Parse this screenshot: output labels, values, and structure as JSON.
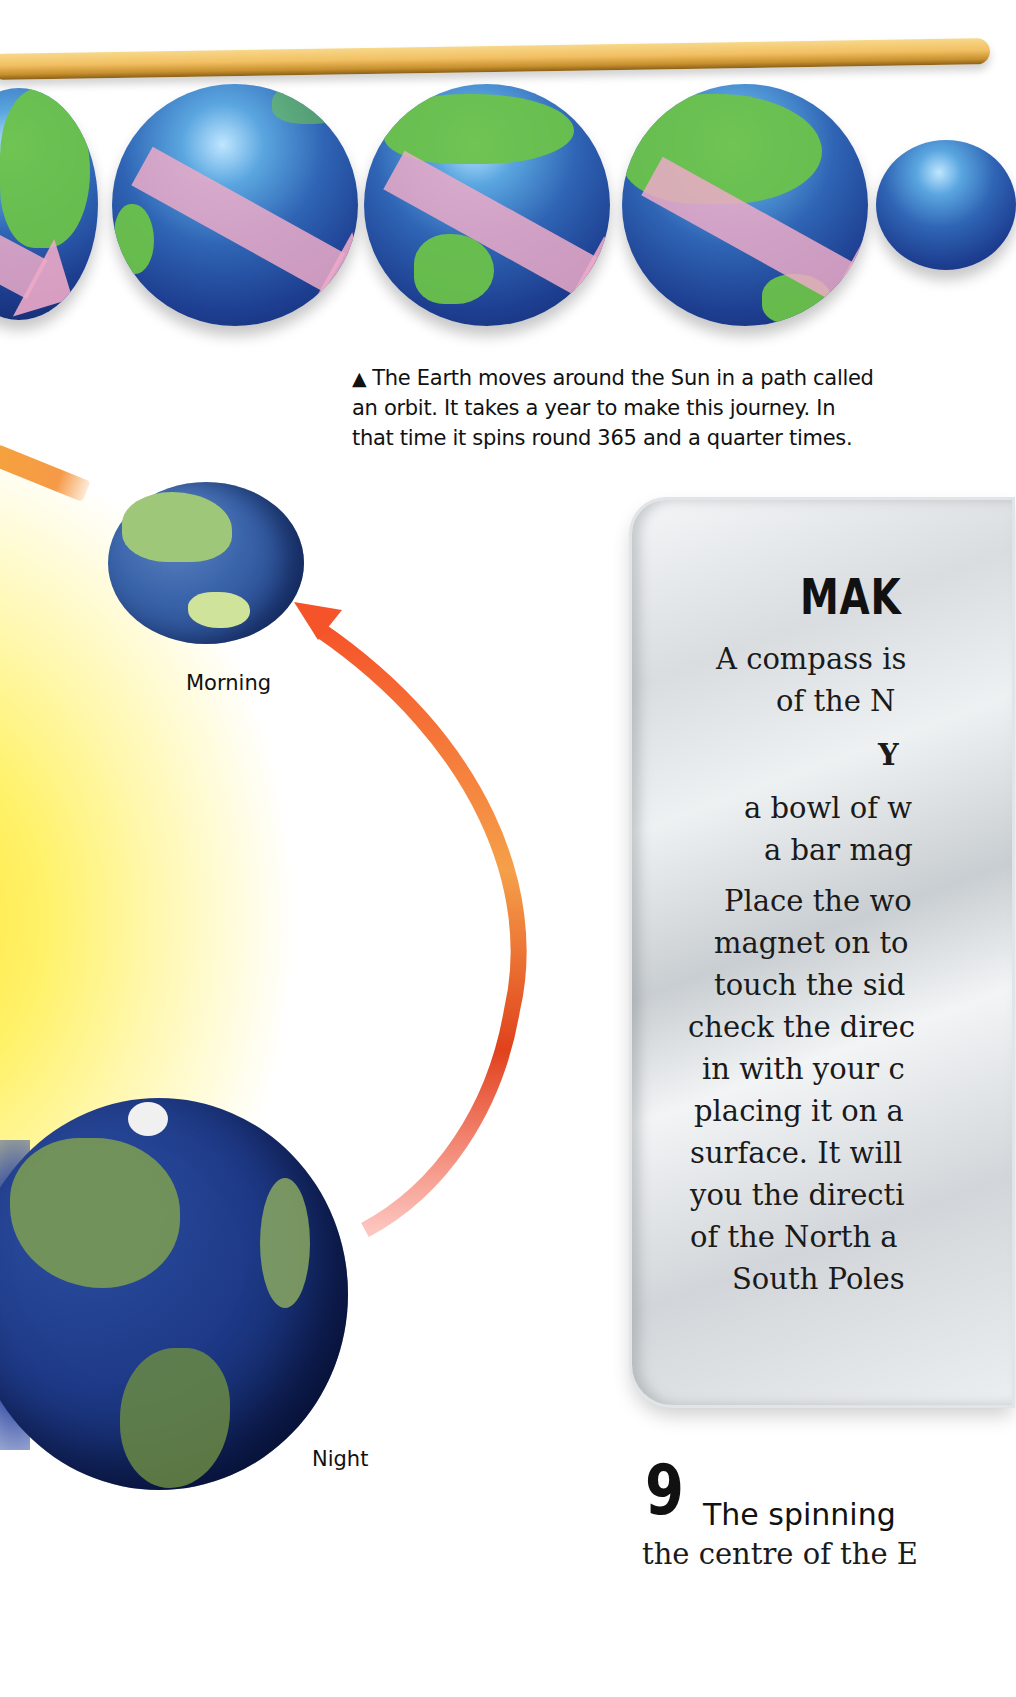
{
  "top_strip": {
    "decoration": "golden-rod",
    "globes": [
      {
        "name": "globe-1",
        "arrow": "pink-spin-arrow"
      },
      {
        "name": "globe-2",
        "arrow": "pink-spin-arrow"
      },
      {
        "name": "globe-3",
        "arrow": "pink-spin-arrow"
      },
      {
        "name": "globe-4",
        "arrow": "pink-spin-arrow"
      },
      {
        "name": "globe-5",
        "arrow": "pink-spin-arrow"
      }
    ],
    "caption": {
      "icon": "up-triangle-icon",
      "icon_glyph": "▲",
      "lines": [
        "The Earth moves around the Sun in a path called",
        "an orbit. It takes a year to make this journey. In",
        "that time it spins round 365 and a quarter times."
      ]
    }
  },
  "diagram": {
    "labels": {
      "morning": "Morning",
      "night": "Night"
    },
    "colors": {
      "sun": "#fff26a",
      "orbit_arrow_start": "#f5542a",
      "orbit_arrow_mid": "#f5a04a",
      "ocean": "#25468a",
      "land": "#7a9a54"
    }
  },
  "compass_panel": {
    "title": "MAK",
    "intro_lines": [
      "A compass is",
      "of the N"
    ],
    "you_need_heading": "Y",
    "materials": [
      "a bowl of w",
      "a bar mag"
    ],
    "instructions": [
      "Place the wo",
      "magnet on to",
      "touch the sid",
      "check the direc",
      "in with your c",
      "placing it on a",
      "surface. It will",
      "you the directi",
      "of the North a",
      "South Poles"
    ]
  },
  "fact": {
    "number": "9",
    "heading": "The spinning",
    "body": "the centre of the E"
  }
}
